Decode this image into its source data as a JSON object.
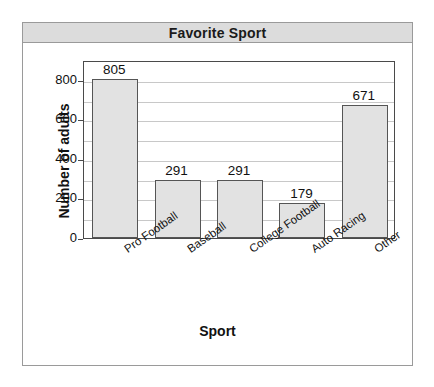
{
  "chart_data": {
    "type": "bar",
    "title": "Favorite Sport",
    "xlabel": "Sport",
    "ylabel": "Number of adults",
    "categories": [
      "Pro Football",
      "Baseball",
      "College Football",
      "Auto Racing",
      "Other"
    ],
    "values": [
      805,
      291,
      291,
      179,
      671
    ],
    "value_labels": [
      "805",
      "291",
      "291",
      "179",
      "671"
    ],
    "ylim": [
      0,
      900
    ],
    "y_ticks": [
      0,
      200,
      400,
      600,
      800
    ],
    "y_tick_labels": [
      "0",
      "200",
      "400",
      "600",
      "800"
    ],
    "gridlines": {
      "horizontal": true,
      "interval": 100,
      "values": [
        100,
        200,
        300,
        400,
        500,
        600,
        700,
        800
      ]
    },
    "legend": null,
    "legend_position": "none",
    "colors": {
      "bar_fill": "#e2e2e2",
      "bar_outline": "#555555",
      "title_banner": "#dcdcdc",
      "frame_border": "#9a9a9a",
      "plot_border": "#4a4a4a",
      "gridline": "#c8c8c8",
      "text": "#111111",
      "background": "#ffffff"
    }
  }
}
